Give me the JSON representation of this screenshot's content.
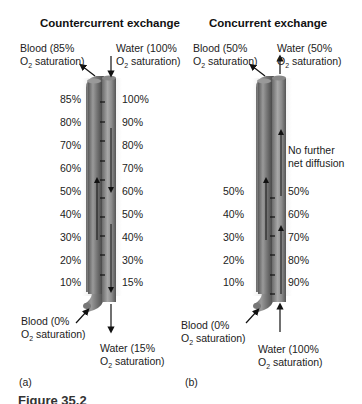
{
  "panel_a": {
    "title": "Countercurrent exchange",
    "letter": "(a)",
    "blood_top": {
      "line1": "Blood (85%",
      "line2_pre": "O",
      "line2_sub": "2",
      "line2_post": " saturation)"
    },
    "water_top": {
      "line1": "Water (100%",
      "line2_pre": "O",
      "line2_sub": "2",
      "line2_post": " saturation)"
    },
    "blood_bottom": {
      "line1": "Blood (0%",
      "line2_pre": "O",
      "line2_sub": "2",
      "line2_post": " saturation)"
    },
    "water_bottom": {
      "line1": "Water (15%",
      "line2_pre": "O",
      "line2_sub": "2",
      "line2_post": " saturation)"
    },
    "blood_values": [
      "85%",
      "80%",
      "70%",
      "60%",
      "50%",
      "40%",
      "30%",
      "20%",
      "10%"
    ],
    "water_values": [
      "100%",
      "90%",
      "80%",
      "70%",
      "60%",
      "50%",
      "40%",
      "30%",
      "15%"
    ]
  },
  "panel_b": {
    "title": "Concurrent exchange",
    "letter": "(b)",
    "blood_top": {
      "line1": "Blood (50%",
      "line2_pre": "O",
      "line2_sub": "2",
      "line2_post": " saturation)"
    },
    "water_top": {
      "line1": "Water (50%",
      "line2_pre": "O",
      "line2_sub": "2",
      "line2_post": " saturation)"
    },
    "blood_bottom": {
      "line1": "Blood (0%",
      "line2_pre": "O",
      "line2_sub": "2",
      "line2_post": " saturation)"
    },
    "water_bottom": {
      "line1": "Water (100%",
      "line2_pre": "O",
      "line2_sub": "2",
      "line2_post": " saturation)"
    },
    "note": {
      "line1": "No further",
      "line2": "net diffusion"
    },
    "blood_values": [
      "50%",
      "40%",
      "30%",
      "20%",
      "10%"
    ],
    "water_values": [
      "50%",
      "60%",
      "70%",
      "80%",
      "90%"
    ]
  },
  "caption": "Figure 35.2"
}
